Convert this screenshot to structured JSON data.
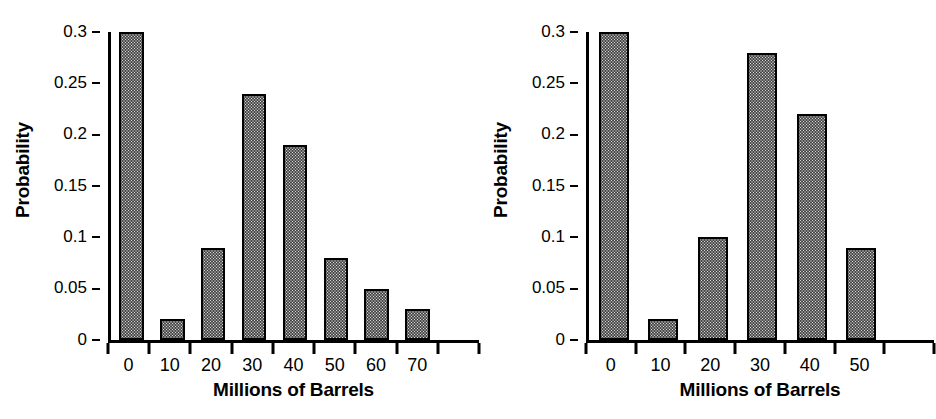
{
  "figure": {
    "background_color": "#ffffff",
    "ink_color": "#000000",
    "bar_fill_color": "#d9d9d9",
    "bar_edge_color": "#000000",
    "bar_fill_pattern": "fine-checkerboard-stipple"
  },
  "chart_data": [
    {
      "type": "bar",
      "panel": "left",
      "title": "",
      "xlabel": "Millions of Barrels",
      "ylabel": "Probability",
      "categories": [
        "0",
        "10",
        "20",
        "30",
        "40",
        "50",
        "60",
        "70"
      ],
      "values": [
        0.3,
        0.02,
        0.09,
        0.24,
        0.19,
        0.08,
        0.05,
        0.03
      ],
      "ylim": [
        0,
        0.3
      ],
      "yticks": [
        0,
        0.05,
        0.1,
        0.15,
        0.2,
        0.25,
        0.3
      ],
      "ytick_labels": [
        "0",
        "0.05",
        "0.1",
        "0.15",
        "0.2",
        "0.25",
        "0.3"
      ],
      "xtick_labels": [
        "0",
        "10",
        "20",
        "30",
        "40",
        "50",
        "60",
        "70"
      ],
      "grid": false,
      "legend": false,
      "legend_position": "none",
      "tick_style": "ticks-at-bin-boundaries-labels-centered",
      "trailing_tick": true
    },
    {
      "type": "bar",
      "panel": "right",
      "title": "",
      "xlabel": "Millions of Barrels",
      "ylabel": "Probability",
      "categories": [
        "0",
        "10",
        "20",
        "30",
        "40",
        "50"
      ],
      "values": [
        0.3,
        0.02,
        0.1,
        0.28,
        0.22,
        0.09
      ],
      "ylim": [
        0,
        0.3
      ],
      "yticks": [
        0,
        0.05,
        0.1,
        0.15,
        0.2,
        0.25,
        0.3
      ],
      "ytick_labels": [
        "0",
        "0.05",
        "0.1",
        "0.15",
        "0.2",
        "0.25",
        "0.3"
      ],
      "xtick_labels": [
        "0",
        "10",
        "20",
        "30",
        "40",
        "50"
      ],
      "grid": false,
      "legend": false,
      "legend_position": "none",
      "tick_style": "ticks-at-bin-boundaries-labels-centered",
      "trailing_tick": true
    }
  ]
}
